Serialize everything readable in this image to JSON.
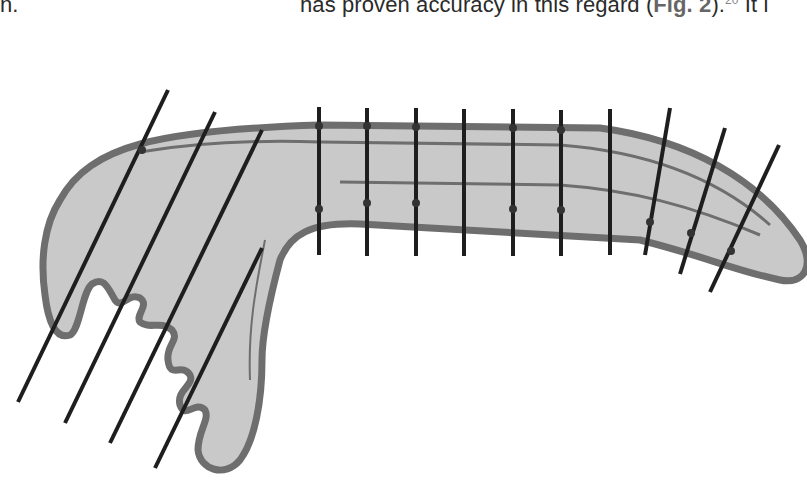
{
  "text": {
    "left_fragment": "n.",
    "right_fragment_pre": "has proven accuracy in this regard (",
    "fig_ref": "Fig. 2",
    "right_fragment_post": ").",
    "superscript": "20",
    "trailing": " It i"
  },
  "figure": {
    "colors": {
      "fill": "#c9c9c9",
      "outline": "#6e6e6e",
      "lines": "#1e1e1e",
      "background": "#ffffff"
    },
    "vertical_lines_x": [
      319,
      367,
      416,
      464,
      513,
      561,
      610
    ],
    "slanted_lines_right_count": 3,
    "slanted_lines_left_count": 4
  }
}
